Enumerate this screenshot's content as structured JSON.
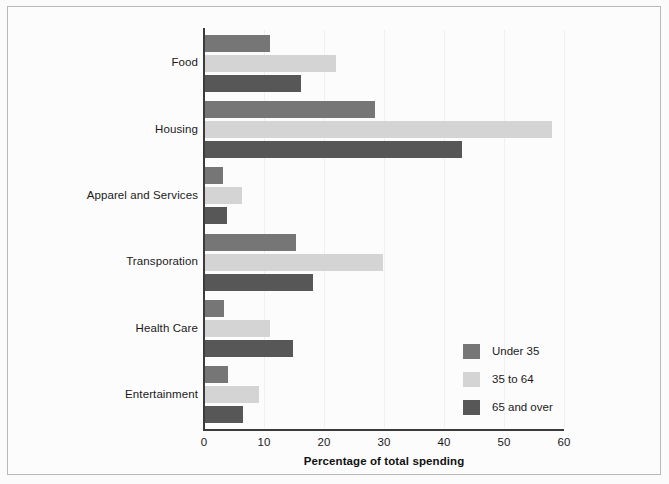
{
  "chart_data": {
    "type": "bar",
    "orientation": "horizontal",
    "title": "",
    "xlabel": "Percentage of total spending",
    "ylabel": "",
    "xlim": [
      0,
      60
    ],
    "xticks": [
      0,
      10,
      20,
      30,
      40,
      50,
      60
    ],
    "grid": true,
    "grid_axis": "x",
    "legend_position": "lower right",
    "categories": [
      "Food",
      "Housing",
      "Apparel and Services",
      "Transporation",
      "Health Care",
      "Entertainment"
    ],
    "series": [
      {
        "name": "Under 35",
        "color": "#767676",
        "values": [
          11.0,
          28.5,
          3.2,
          15.3,
          3.3,
          4.0
        ]
      },
      {
        "name": "35 to 64",
        "color": "#d4d4d4",
        "values": [
          22.0,
          58.0,
          6.3,
          29.8,
          11.0,
          9.2
        ]
      },
      {
        "name": "65 and over",
        "color": "#575757",
        "values": [
          16.2,
          43.0,
          3.8,
          18.2,
          14.8,
          6.5
        ]
      }
    ]
  },
  "legend": {
    "entries": [
      {
        "label": "Under 35",
        "color": "#767676"
      },
      {
        "label": "35 to 64",
        "color": "#d4d4d4"
      },
      {
        "label": "65 and over",
        "color": "#575757"
      }
    ]
  }
}
